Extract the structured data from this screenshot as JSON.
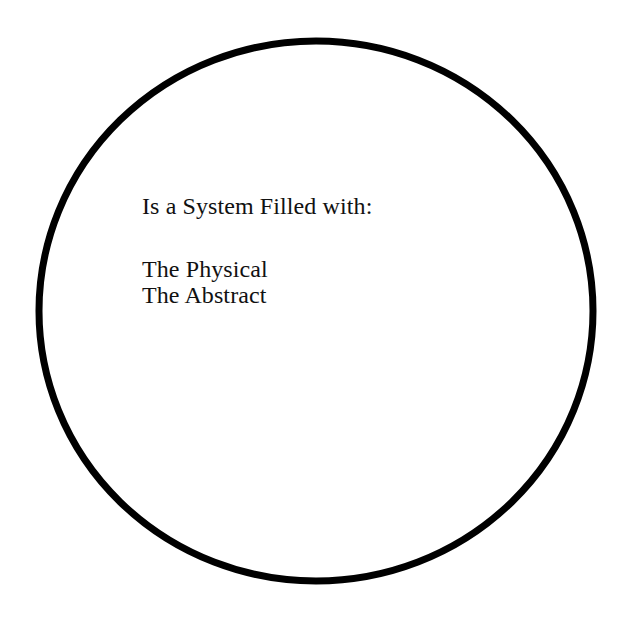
{
  "diagram": {
    "type": "venn-single-set",
    "background_color": "#ffffff",
    "shape": {
      "name": "circle",
      "stroke_color": "#000000",
      "fill_color": "#ffffff",
      "stroke_width_px": 7,
      "center_x": 316,
      "center_y": 311,
      "radius_x": 277,
      "radius_y": 270
    },
    "text_block": {
      "heading": "Is a System Filled with:",
      "blank_line": "",
      "items": [
        "The Physical",
        "The Abstract"
      ],
      "text_color": "#111111",
      "align": "left"
    }
  }
}
